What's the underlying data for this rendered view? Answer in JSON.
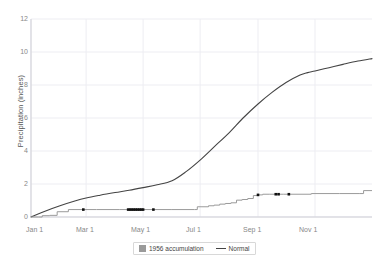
{
  "chart_data": {
    "type": "line",
    "title": "",
    "xlabel": "",
    "ylabel": "Precipitation (inches)",
    "ylim": [
      0,
      12
    ],
    "yticks": [
      0,
      2,
      4,
      6,
      8,
      10,
      12
    ],
    "ytick_labels": [
      "0",
      "2",
      "4",
      "6",
      "8",
      "10",
      "12"
    ],
    "xlim": [
      "Jan 1",
      "Dec 31"
    ],
    "xticks": [
      "Jan 1",
      "Mar 1",
      "May 1",
      "Jul 1",
      "Sep 1",
      "Nov 1"
    ],
    "xtick_labels": [
      "Jan 1",
      "Mar 1",
      "May 1",
      "Jul 1",
      "Sep 1",
      "Nov 1"
    ],
    "grid": true,
    "legend_position": "bottom-center",
    "series": [
      {
        "name": "1956 accumulation",
        "style": "step",
        "color": "#9a9a9a",
        "x_days": [
          0,
          8,
          12,
          20,
          28,
          40,
          55,
          70,
          95,
          120,
          150,
          175,
          178,
          182,
          190,
          196,
          202,
          208,
          214,
          220,
          226,
          232,
          238,
          242,
          244,
          248,
          255,
          262,
          270,
          300,
          330,
          352,
          356,
          365
        ],
        "values": [
          0,
          0,
          0.08,
          0.1,
          0.32,
          0.45,
          0.45,
          0.45,
          0.45,
          0.45,
          0.45,
          0.45,
          0.62,
          0.62,
          0.68,
          0.72,
          0.78,
          0.82,
          0.86,
          1.02,
          1.06,
          1.12,
          1.3,
          1.34,
          1.34,
          1.38,
          1.38,
          1.38,
          1.38,
          1.42,
          1.42,
          1.42,
          1.6,
          1.6
        ]
      },
      {
        "name": "Normal",
        "style": "smooth-line",
        "color": "#444444",
        "x_days": [
          0,
          15,
          31,
          46,
          59,
          74,
          90,
          105,
          120,
          135,
          151,
          166,
          181,
          196,
          212,
          227,
          243,
          258,
          273,
          288,
          296,
          304,
          319,
          334,
          350,
          365
        ],
        "values": [
          0.0,
          0.35,
          0.68,
          0.95,
          1.15,
          1.32,
          1.48,
          1.62,
          1.78,
          1.95,
          2.2,
          2.75,
          3.45,
          4.25,
          5.1,
          6.0,
          6.85,
          7.55,
          8.15,
          8.6,
          8.75,
          8.85,
          9.05,
          9.25,
          9.45,
          9.6
        ]
      }
    ],
    "event_markers": {
      "name": "precipitation event markers",
      "color": "#111111",
      "points": [
        {
          "x_day": 56,
          "y": 0.45
        },
        {
          "x_day": 104,
          "y": 0.45
        },
        {
          "x_day": 106,
          "y": 0.45
        },
        {
          "x_day": 108,
          "y": 0.45
        },
        {
          "x_day": 110,
          "y": 0.45
        },
        {
          "x_day": 112,
          "y": 0.45
        },
        {
          "x_day": 114,
          "y": 0.45
        },
        {
          "x_day": 116,
          "y": 0.45
        },
        {
          "x_day": 118,
          "y": 0.45
        },
        {
          "x_day": 120,
          "y": 0.45
        },
        {
          "x_day": 131,
          "y": 0.45
        },
        {
          "x_day": 243,
          "y": 1.34
        },
        {
          "x_day": 262,
          "y": 1.38
        },
        {
          "x_day": 265,
          "y": 1.38
        },
        {
          "x_day": 276,
          "y": 1.38
        }
      ]
    }
  },
  "legend": {
    "items": [
      {
        "label": "1956 accumulation",
        "marker": "square-swatch"
      },
      {
        "label": "Normal",
        "marker": "line"
      }
    ]
  },
  "axis": {
    "y_title": "Precipitation (inches)"
  }
}
